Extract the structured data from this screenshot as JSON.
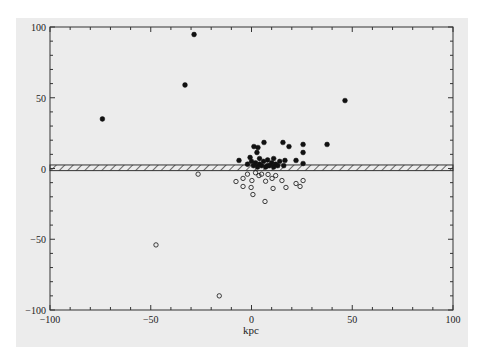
{
  "chart_data": {
    "type": "scatter",
    "title": "",
    "xlabel": "kpc",
    "ylabel": "",
    "xlim": [
      -100,
      100
    ],
    "ylim": [
      -100,
      100
    ],
    "x_ticks": [
      -100,
      -50,
      0,
      50,
      100
    ],
    "y_ticks": [
      -100,
      -50,
      0,
      50,
      100
    ],
    "x_tick_labels": [
      "−100",
      "−50",
      "0",
      "50",
      "100"
    ],
    "y_tick_labels": [
      "−100",
      "−50",
      "0",
      "50",
      "100"
    ],
    "minor_tick_step": 10,
    "grid": false,
    "legend": null,
    "annotations": [
      {
        "type": "hatched-band",
        "y_range": [
          -1.5,
          2.5
        ],
        "x_range": [
          -100,
          100
        ],
        "description": "galactic plane"
      }
    ],
    "series": [
      {
        "name": "filled (above plane)",
        "marker": "filled-circle",
        "color": "#111111",
        "points": [
          [
            -28.5,
            94.7
          ],
          [
            -33,
            59
          ],
          [
            -74,
            35
          ],
          [
            46.4,
            48
          ],
          [
            37.5,
            17
          ],
          [
            1.2,
            15.5
          ],
          [
            3.2,
            14.8
          ],
          [
            6.2,
            18.4
          ],
          [
            2.7,
            11.3
          ],
          [
            15.6,
            18.4
          ],
          [
            18.6,
            15.5
          ],
          [
            25.6,
            17
          ],
          [
            25.6,
            11.3
          ],
          [
            16.6,
            5.7
          ],
          [
            22.1,
            5.7
          ],
          [
            25.6,
            3.5
          ],
          [
            -6.2,
            5.7
          ],
          [
            -0.7,
            7.8
          ],
          [
            2,
            4
          ],
          [
            4,
            3
          ],
          [
            6,
            5
          ],
          [
            8,
            2
          ],
          [
            10,
            4
          ],
          [
            12,
            3
          ],
          [
            14,
            5
          ],
          [
            3,
            1
          ],
          [
            5,
            2
          ],
          [
            7,
            1
          ],
          [
            9,
            2
          ],
          [
            11,
            1
          ],
          [
            13,
            2
          ],
          [
            1,
            2
          ],
          [
            0,
            5
          ],
          [
            4,
            7
          ],
          [
            8,
            6
          ],
          [
            11,
            7
          ],
          [
            -2,
            3
          ],
          [
            16,
            2
          ]
        ]
      },
      {
        "name": "open (below plane)",
        "marker": "open-circle",
        "color": "#111111",
        "points": [
          [
            -47.4,
            -54
          ],
          [
            -16,
            -90
          ],
          [
            -26.5,
            -4
          ],
          [
            -7.7,
            -9.2
          ],
          [
            -4.2,
            -7
          ],
          [
            -4.2,
            -12.7
          ],
          [
            0.2,
            -8.5
          ],
          [
            -0.2,
            -13.4
          ],
          [
            0.7,
            -18.4
          ],
          [
            6.7,
            -23.3
          ],
          [
            10.2,
            -7
          ],
          [
            15.1,
            -8.5
          ],
          [
            17.1,
            -13.4
          ],
          [
            22.1,
            -10.6
          ],
          [
            25.6,
            -8.5
          ],
          [
            24.1,
            -12.7
          ],
          [
            10.7,
            -14.1
          ],
          [
            3.7,
            -5
          ],
          [
            8.2,
            -4.2
          ],
          [
            2,
            -3
          ],
          [
            5,
            -4
          ],
          [
            12,
            -5
          ],
          [
            -2,
            -4
          ],
          [
            7,
            -9
          ]
        ]
      }
    ]
  }
}
